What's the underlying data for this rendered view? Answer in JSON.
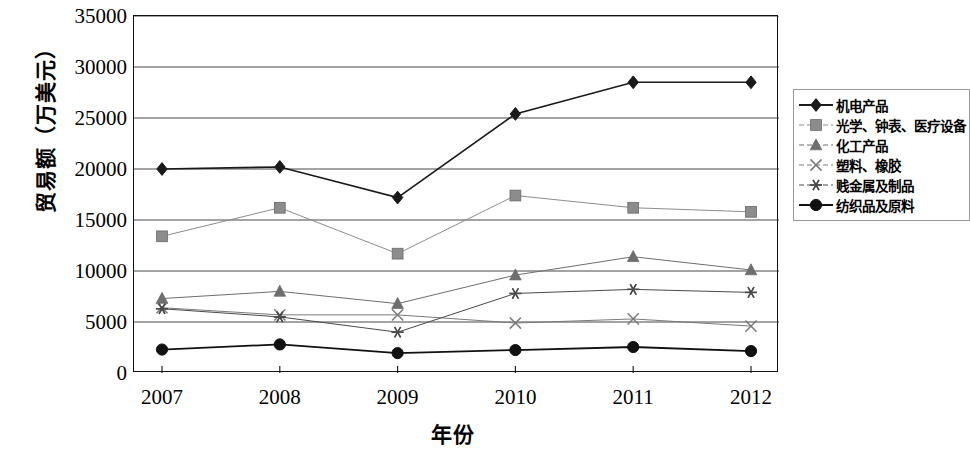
{
  "chart_data": {
    "type": "line",
    "title": "",
    "xlabel": "年份",
    "ylabel": "贸易额（万美元）",
    "categories": [
      "2007",
      "2008",
      "2009",
      "2010",
      "2011",
      "2012"
    ],
    "x_tick_labels": [
      "2007",
      "2008",
      "2009",
      "2010",
      "2011",
      "2012"
    ],
    "y_tick_labels": [
      "0",
      "5000",
      "10000",
      "15000",
      "20000",
      "25000",
      "30000",
      "35000"
    ],
    "y_ticks": [
      0,
      5000,
      10000,
      15000,
      20000,
      25000,
      30000,
      35000
    ],
    "ylim": [
      0,
      35000
    ],
    "grid": "horizontal",
    "legend_position": "right",
    "series": [
      {
        "name": "机电产品",
        "marker": "diamond",
        "color": "#1a1a1a",
        "line_width": 1.6,
        "values": [
          20000,
          20200,
          17200,
          25400,
          28500,
          28500
        ]
      },
      {
        "name": "光学、钟表、医疗设备",
        "marker": "square",
        "color": "#8c8c8c",
        "line_width": 1.0,
        "values": [
          13400,
          16200,
          11700,
          17400,
          16200,
          15800
        ]
      },
      {
        "name": "化工产品",
        "marker": "triangle",
        "color": "#6e6e6e",
        "line_width": 1.0,
        "values": [
          7300,
          8000,
          6800,
          9600,
          11400,
          10100
        ]
      },
      {
        "name": "塑料、橡胶",
        "marker": "cross",
        "color": "#7a7a7a",
        "line_width": 1.0,
        "values": [
          6400,
          5700,
          5700,
          4900,
          5300,
          4600
        ]
      },
      {
        "name": "贱金属及制品",
        "marker": "star",
        "color": "#4a4a4a",
        "line_width": 1.0,
        "values": [
          6300,
          5500,
          4000,
          7800,
          8200,
          7900
        ]
      },
      {
        "name": "纺织品及原料",
        "marker": "circle",
        "color": "#111111",
        "line_width": 1.8,
        "values": [
          2300,
          2800,
          1950,
          2250,
          2550,
          2150
        ]
      }
    ]
  }
}
